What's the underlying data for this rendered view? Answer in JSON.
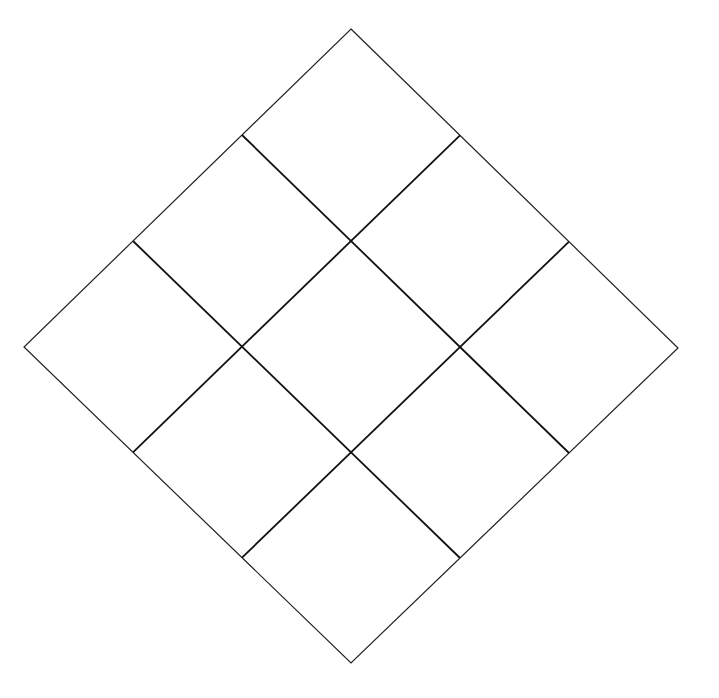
{
  "diagram": {
    "type": "rotated-grid",
    "rows": 3,
    "cols": 3,
    "vertices": {
      "top": [
        351,
        29
      ],
      "right": [
        678,
        348
      ],
      "bottom": [
        351,
        663
      ],
      "left": [
        24,
        347
      ]
    },
    "colors": {
      "background": "#ffffff",
      "outline": "#222222",
      "grid": "#111111"
    },
    "stroke": {
      "outline": 1.2,
      "grid": 1.8
    }
  }
}
